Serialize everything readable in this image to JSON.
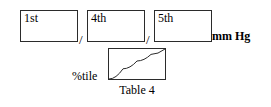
{
  "form": {
    "unit_label": "mm Hg",
    "separator": "/",
    "fields": [
      {
        "label": "1st",
        "value": "",
        "placeholder": ""
      },
      {
        "label": "4th",
        "value": "",
        "placeholder": ""
      },
      {
        "label": "5th",
        "value": "",
        "placeholder": ""
      }
    ]
  },
  "percentile": {
    "axis_label": "%tile",
    "caption": "Table 4",
    "value": ""
  },
  "chart_data": {
    "type": "line",
    "title": "Table 4",
    "xlabel": "",
    "ylabel": "%tile",
    "x": [
      0,
      25,
      50,
      75,
      100
    ],
    "values": [
      0,
      34,
      60,
      82,
      100
    ],
    "xlim": [
      0,
      100
    ],
    "ylim": [
      0,
      100
    ],
    "grid": false,
    "legend": "none",
    "series": [
      {
        "name": "%tile",
        "values": [
          0,
          34,
          60,
          82,
          100
        ]
      }
    ]
  },
  "style": {
    "ink": "#2b2b2b",
    "paper": "#ffffff"
  }
}
